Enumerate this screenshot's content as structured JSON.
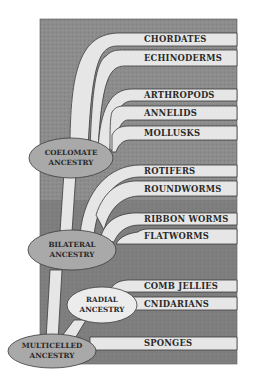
{
  "diagram": {
    "type": "phylogenetic-tree",
    "colors": {
      "background": "#ffffff",
      "panel": "#8c8c8c",
      "panel_dark": "#6f6f6f",
      "branch": "#e6e6e6",
      "branch_outline": "#3a3a3a",
      "ellipse_fill": "#a9a9a9",
      "radial_ellipse_fill": "#ececec",
      "text": "#2a2a2a"
    },
    "groups": [
      {
        "id": "chordates",
        "label": "CHORDATES"
      },
      {
        "id": "echinoderms",
        "label": "ECHINODERMS"
      },
      {
        "id": "arthropods",
        "label": "ARTHROPODS"
      },
      {
        "id": "annelids",
        "label": "ANNELIDS"
      },
      {
        "id": "mollusks",
        "label": "MOLLUSKS"
      },
      {
        "id": "rotifers",
        "label": "ROTIFERS"
      },
      {
        "id": "roundworms",
        "label": "ROUNDWORMS"
      },
      {
        "id": "ribbon-worms",
        "label": "RIBBON WORMS"
      },
      {
        "id": "flatworms",
        "label": "FLATWORMS"
      },
      {
        "id": "comb-jellies",
        "label": "COMB JELLIES"
      },
      {
        "id": "cnidarians",
        "label": "CNIDARIANS"
      },
      {
        "id": "sponges",
        "label": "SPONGES"
      }
    ],
    "ancestors": [
      {
        "id": "coelomate",
        "line1": "COELOMATE",
        "line2": "ANCESTRY"
      },
      {
        "id": "bilateral",
        "line1": "BILATERAL",
        "line2": "ANCESTRY"
      },
      {
        "id": "radial",
        "line1": "RADIAL",
        "line2": "ANCESTRY"
      },
      {
        "id": "multicelled",
        "line1": "MULTICELLED",
        "line2": "ANCESTRY"
      }
    ]
  }
}
